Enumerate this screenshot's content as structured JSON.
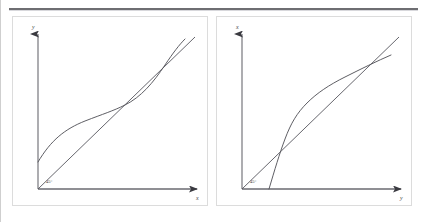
{
  "figure": {
    "type": "diagram",
    "top_rule": true,
    "panel_count": 2
  },
  "panels": [
    {
      "id": "left",
      "axes": {
        "vertical_label": "y",
        "horizontal_label": "x",
        "origin_angle_label": "45°",
        "arrowheads": [
          "up",
          "right"
        ]
      },
      "curves": [
        {
          "name": "reference-line",
          "kind": "straight",
          "label": "45° line",
          "points": [
            [
              0,
              0
            ],
            [
              1,
              1
            ]
          ]
        },
        {
          "name": "transfer-curve",
          "kind": "s-curve-flat",
          "label": "compressive S curve",
          "points": [
            [
              0.0,
              0.17
            ],
            [
              0.08,
              0.26
            ],
            [
              0.18,
              0.36
            ],
            [
              0.3,
              0.44
            ],
            [
              0.45,
              0.5
            ],
            [
              0.58,
              0.56
            ],
            [
              0.7,
              0.64
            ],
            [
              0.82,
              0.75
            ],
            [
              0.92,
              0.88
            ],
            [
              1.0,
              1.0
            ]
          ]
        }
      ]
    },
    {
      "id": "right",
      "axes": {
        "vertical_label": "x",
        "horizontal_label": "y",
        "origin_angle_label": "45°",
        "arrowheads": [
          "up",
          "right"
        ]
      },
      "curves": [
        {
          "name": "reference-line",
          "kind": "straight",
          "label": "45° line",
          "points": [
            [
              0,
              0
            ],
            [
              1,
              1
            ]
          ]
        },
        {
          "name": "transfer-curve",
          "kind": "s-curve-steep",
          "label": "expansive S curve",
          "points": [
            [
              0.17,
              0.0
            ],
            [
              0.26,
              0.08
            ],
            [
              0.36,
              0.18
            ],
            [
              0.44,
              0.3
            ],
            [
              0.5,
              0.45
            ],
            [
              0.56,
              0.58
            ],
            [
              0.64,
              0.7
            ],
            [
              0.75,
              0.82
            ],
            [
              0.88,
              0.92
            ],
            [
              1.0,
              1.0
            ]
          ]
        }
      ]
    }
  ],
  "colors": {
    "rule": "#6e6e72",
    "panel_border": "#dcdcdc",
    "axis": "#6a6a70",
    "curve": "#55555c",
    "text": "#4a4a4a",
    "background": "#ffffff"
  }
}
